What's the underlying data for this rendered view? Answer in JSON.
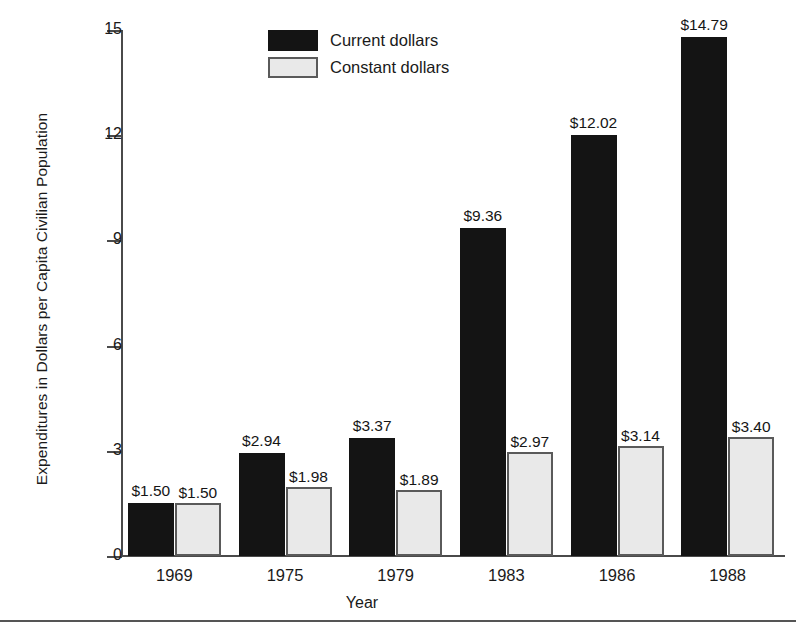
{
  "chart_data": {
    "type": "bar",
    "title": "",
    "xlabel": "Year",
    "ylabel": "Expenditures in Dollars per Capita Civilian Population",
    "categories": [
      "1969",
      "1975",
      "1979",
      "1983",
      "1986",
      "1988"
    ],
    "ylim": [
      0,
      15
    ],
    "yticks": [
      0,
      3,
      6,
      9,
      12,
      15
    ],
    "ytick_labels": [
      "0",
      "3",
      "6",
      "9",
      "12",
      "15"
    ],
    "grid": false,
    "legend_position": "top-center",
    "series": [
      {
        "name": "Current dollars",
        "color": "#141414",
        "values": [
          1.5,
          2.94,
          3.37,
          9.36,
          12.02,
          14.79
        ],
        "labels": [
          "$1.50",
          "$2.94",
          "$3.37",
          "$9.36",
          "$12.02",
          "$14.79"
        ]
      },
      {
        "name": "Constant dollars",
        "color": "#e9e9e9",
        "border_color": "#5a5a5a",
        "values": [
          1.5,
          1.98,
          1.89,
          2.97,
          3.14,
          3.4
        ],
        "labels": [
          "$1.50",
          "$1.98",
          "$1.89",
          "$2.97",
          "$3.14",
          "$3.40"
        ]
      }
    ]
  },
  "legend": {
    "items": [
      {
        "label": "Current dollars",
        "swatch": "current"
      },
      {
        "label": "Constant dollars",
        "swatch": "constant"
      }
    ]
  }
}
